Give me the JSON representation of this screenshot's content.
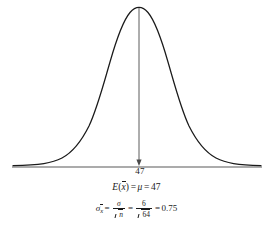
{
  "figure": {
    "name": "sampling-distribution-normal-curve",
    "background_color": "#ffffff",
    "line_color": "#1a1a1a",
    "axis_color": "#8a8a8a"
  },
  "axis": {
    "tick_label": "47",
    "center_value": 47,
    "x_start_px": 12,
    "x_end_px": 262,
    "y_px": 167
  },
  "curve": {
    "type": "normal-density",
    "mean_x_px": 139,
    "peak_y_px": 8,
    "baseline_y_px": 166,
    "std_px": 40
  },
  "pointer": {
    "name": "mean-indicator-line",
    "from_y_px": 8,
    "to_y_px": 165,
    "x_px": 139,
    "has_arrowhead": true
  },
  "formulas": {
    "expectation": {
      "label": "E",
      "open_paren": "(",
      "variable": "x",
      "close_paren": ")",
      "equals_1": "=",
      "mu": "μ",
      "equals_2": "=",
      "value": "47",
      "plain_text": "E(x̄) = μ = 47"
    },
    "standard_error": {
      "sigma": "σ",
      "subscript": "x",
      "equals_1": "=",
      "frac1_num": "σ",
      "frac1_den_radicand": "n",
      "equals_2": "=",
      "frac2_num": "6",
      "frac2_den_radicand": "64",
      "equals_3": "=",
      "value": "0.75",
      "plain_text": "σx̄ = σ/√n = 6/√64 = 0.75"
    }
  }
}
